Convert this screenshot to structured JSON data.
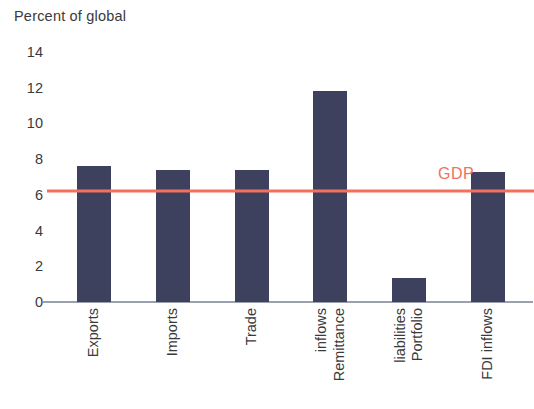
{
  "chart_data": {
    "type": "bar",
    "title": "Percent of global",
    "xlabel": "",
    "ylabel": "",
    "ylim": [
      0,
      14
    ],
    "yticks": [
      0,
      2,
      4,
      6,
      8,
      10,
      12,
      14
    ],
    "grid": false,
    "legend": "none",
    "categories": [
      "Exports",
      "Imports",
      "Trade",
      "Remittance inflows",
      "Portfolio liabilities",
      "FDI inflows"
    ],
    "category_lines": [
      [
        "Exports"
      ],
      [
        "Imports"
      ],
      [
        "Trade"
      ],
      [
        "Remittance",
        "inflows"
      ],
      [
        "Portfolio",
        "liabilities"
      ],
      [
        "FDI inflows"
      ]
    ],
    "values": [
      7.6,
      7.4,
      7.4,
      11.8,
      1.35,
      7.3
    ],
    "bar_color": "#3d415e",
    "annotations": [
      {
        "type": "hline",
        "label": "GDP",
        "value": 6.2,
        "color": "#f4705c"
      }
    ]
  },
  "axis": {
    "tick_labels": [
      "14",
      "12",
      "10",
      "8",
      "6",
      "4",
      "2",
      "0"
    ]
  }
}
